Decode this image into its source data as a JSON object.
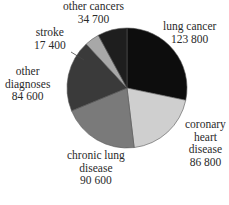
{
  "chart_data": {
    "type": "pie",
    "title": "",
    "start": "top",
    "direction": "clockwise",
    "slices": [
      {
        "label": "lung cancer",
        "lines": [
          "lung cancer",
          "123 800"
        ],
        "value": 123800,
        "color": "#0d0d0d"
      },
      {
        "label": "coronary heart disease",
        "lines": [
          "coronary",
          "heart",
          "disease",
          "86 800"
        ],
        "value": 86800,
        "color": "#cfcfcf"
      },
      {
        "label": "chronic lung disease",
        "lines": [
          "chronic lung",
          "disease",
          "90 600"
        ],
        "value": 90600,
        "color": "#7a7a7a"
      },
      {
        "label": "other diagnoses",
        "lines": [
          "other",
          "diagnoses",
          "84 600"
        ],
        "value": 84600,
        "color": "#3a3a3a"
      },
      {
        "label": "stroke",
        "lines": [
          "stroke",
          "17 400"
        ],
        "value": 17400,
        "color": "#a8a8a8"
      },
      {
        "label": "other cancers",
        "lines": [
          "other cancers",
          "34 700"
        ],
        "value": 34700,
        "color": "#1e1e1e"
      }
    ]
  }
}
